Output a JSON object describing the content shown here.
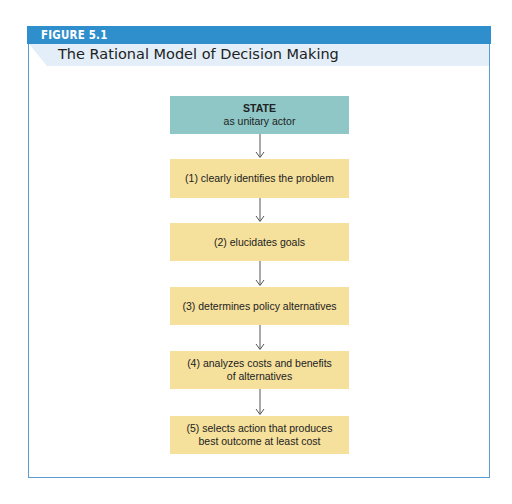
{
  "figure": {
    "label": "FIGURE 5.1",
    "title": "The Rational Model of Decision Making"
  },
  "colors": {
    "header_blue": "#2f8fcc",
    "title_band": "#e3eef8",
    "state_box": "#8ec7c6",
    "step_box": "#f5e09c",
    "frame_border": "#5a9ccf"
  },
  "diagram": {
    "start": {
      "title": "STATE",
      "subtitle": "as unitary actor"
    },
    "steps": [
      {
        "line1": "(1) clearly identifies the problem",
        "line2": ""
      },
      {
        "line1": "(2) elucidates goals",
        "line2": ""
      },
      {
        "line1": "(3) determines policy alternatives",
        "line2": ""
      },
      {
        "line1": "(4) analyzes costs and benefits",
        "line2": "of alternatives"
      },
      {
        "line1": "(5) selects action that produces",
        "line2": "best outcome at least cost"
      }
    ]
  }
}
